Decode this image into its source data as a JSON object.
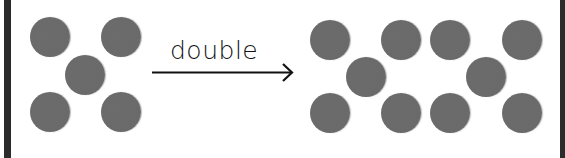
{
  "diagram": {
    "operation_label": "double",
    "colors": {
      "dot": "#6b6b6b",
      "border": "#2b2b2b",
      "text": "#111111",
      "background": "#ffffff"
    },
    "left_group": {
      "count": 5,
      "arrangement": "dice-five",
      "dots": [
        {
          "x": 50,
          "y": 37
        },
        {
          "x": 121,
          "y": 37
        },
        {
          "x": 85,
          "y": 75
        },
        {
          "x": 50,
          "y": 112
        },
        {
          "x": 121,
          "y": 112
        }
      ]
    },
    "right_group": {
      "count": 10,
      "arrangement": "two dice-five patterns",
      "dots": [
        {
          "x": 330,
          "y": 40
        },
        {
          "x": 401,
          "y": 40
        },
        {
          "x": 366,
          "y": 77
        },
        {
          "x": 330,
          "y": 113
        },
        {
          "x": 401,
          "y": 113
        },
        {
          "x": 450,
          "y": 40
        },
        {
          "x": 522,
          "y": 40
        },
        {
          "x": 486,
          "y": 77
        },
        {
          "x": 450,
          "y": 113
        },
        {
          "x": 522,
          "y": 113
        }
      ]
    }
  }
}
